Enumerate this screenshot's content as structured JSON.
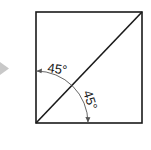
{
  "diagram": {
    "colors": {
      "stroke": "#1a1a1a",
      "arc": "#555555",
      "pointer": "#c8c8c8",
      "background": "#ffffff"
    },
    "square": {
      "x": 36,
      "y": 12,
      "width": 106,
      "height": 111
    },
    "diagonal": {
      "from": [
        36,
        123
      ],
      "to": [
        142,
        12
      ]
    },
    "arc": {
      "center": [
        36,
        123
      ],
      "radius": 52,
      "start_deg": 90,
      "end_deg": 0
    },
    "angles": [
      {
        "label": "45°",
        "position": "upper",
        "x": 47,
        "y": 72,
        "rotate": 8
      },
      {
        "label": "45°",
        "position": "lower",
        "x": 83,
        "y": 92,
        "rotate": 72
      }
    ],
    "pointer": {
      "shape": "triangle",
      "direction": "right"
    }
  }
}
